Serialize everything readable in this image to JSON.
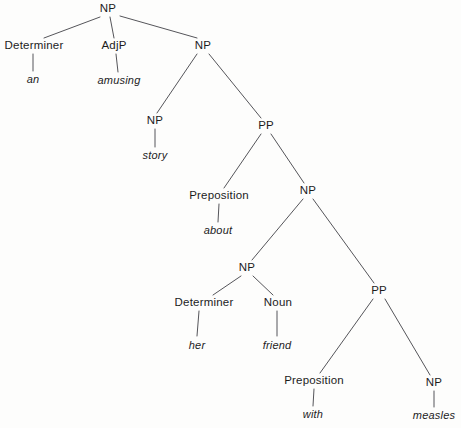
{
  "diagram": {
    "sentence": "an amusing story about her friend with measles",
    "line_color": "#55555a",
    "text_color": "#1c1c1c",
    "background_color": "#fdfdfc",
    "nodes": [
      {
        "id": "np-root",
        "label": "NP",
        "kind": "category",
        "x": 108,
        "y": 9
      },
      {
        "id": "det-1",
        "label": "Determiner",
        "kind": "category",
        "x": 34,
        "y": 46
      },
      {
        "id": "word-an",
        "label": "an",
        "kind": "word",
        "x": 33,
        "y": 79
      },
      {
        "id": "adjp-1",
        "label": "AdjP",
        "kind": "category",
        "x": 114,
        "y": 46
      },
      {
        "id": "word-amusing",
        "label": "amusing",
        "kind": "word",
        "x": 119,
        "y": 80
      },
      {
        "id": "np-2",
        "label": "NP",
        "kind": "category",
        "x": 203,
        "y": 46
      },
      {
        "id": "np-story",
        "label": "NP",
        "kind": "category",
        "x": 155,
        "y": 121
      },
      {
        "id": "word-story",
        "label": "story",
        "kind": "word",
        "x": 155,
        "y": 155
      },
      {
        "id": "pp-1",
        "label": "PP",
        "kind": "category",
        "x": 266,
        "y": 126
      },
      {
        "id": "prep-1",
        "label": "Preposition",
        "kind": "category",
        "x": 219,
        "y": 196
      },
      {
        "id": "word-about",
        "label": "about",
        "kind": "word",
        "x": 218,
        "y": 230
      },
      {
        "id": "np-3",
        "label": "NP",
        "kind": "category",
        "x": 308,
        "y": 191
      },
      {
        "id": "np-4",
        "label": "NP",
        "kind": "category",
        "x": 247,
        "y": 268
      },
      {
        "id": "det-2",
        "label": "Determiner",
        "kind": "category",
        "x": 204,
        "y": 303
      },
      {
        "id": "word-her",
        "label": "her",
        "kind": "word",
        "x": 197,
        "y": 345
      },
      {
        "id": "noun-1",
        "label": "Noun",
        "kind": "category",
        "x": 278,
        "y": 303
      },
      {
        "id": "word-friend",
        "label": "friend",
        "kind": "word",
        "x": 277,
        "y": 345
      },
      {
        "id": "pp-2",
        "label": "PP",
        "kind": "category",
        "x": 379,
        "y": 291
      },
      {
        "id": "prep-2",
        "label": "Preposition",
        "kind": "category",
        "x": 314,
        "y": 381
      },
      {
        "id": "word-with",
        "label": "with",
        "kind": "word",
        "x": 313,
        "y": 414
      },
      {
        "id": "np-5",
        "label": "NP",
        "kind": "category",
        "x": 434,
        "y": 383
      },
      {
        "id": "word-measles",
        "label": "measles",
        "kind": "word",
        "x": 434,
        "y": 415
      }
    ],
    "edges": [
      {
        "from": "np-root",
        "to": "det-1",
        "x1": 100,
        "y1": 17,
        "x2": 44,
        "y2": 38
      },
      {
        "from": "np-root",
        "to": "adjp-1",
        "x1": 110,
        "y1": 17,
        "x2": 114,
        "y2": 38
      },
      {
        "from": "np-root",
        "to": "np-2",
        "x1": 120,
        "y1": 16,
        "x2": 197,
        "y2": 38
      },
      {
        "from": "det-1",
        "to": "word-an",
        "x1": 33,
        "y1": 54,
        "x2": 33,
        "y2": 71
      },
      {
        "from": "adjp-1",
        "to": "word-amusing",
        "x1": 116,
        "y1": 54,
        "x2": 118,
        "y2": 72
      },
      {
        "from": "np-2",
        "to": "np-story",
        "x1": 197,
        "y1": 54,
        "x2": 157,
        "y2": 113
      },
      {
        "from": "np-2",
        "to": "pp-1",
        "x1": 209,
        "y1": 54,
        "x2": 261,
        "y2": 118
      },
      {
        "from": "np-story",
        "to": "word-story",
        "x1": 155,
        "y1": 129,
        "x2": 155,
        "y2": 147
      },
      {
        "from": "pp-1",
        "to": "prep-1",
        "x1": 261,
        "y1": 134,
        "x2": 224,
        "y2": 188
      },
      {
        "from": "pp-1",
        "to": "np-3",
        "x1": 271,
        "y1": 134,
        "x2": 304,
        "y2": 183
      },
      {
        "from": "prep-1",
        "to": "word-about",
        "x1": 219,
        "y1": 204,
        "x2": 218,
        "y2": 222
      },
      {
        "from": "np-3",
        "to": "np-4",
        "x1": 303,
        "y1": 199,
        "x2": 252,
        "y2": 260
      },
      {
        "from": "np-3",
        "to": "pp-2",
        "x1": 313,
        "y1": 199,
        "x2": 374,
        "y2": 283
      },
      {
        "from": "np-4",
        "to": "det-2",
        "x1": 241,
        "y1": 276,
        "x2": 213,
        "y2": 295
      },
      {
        "from": "np-4",
        "to": "noun-1",
        "x1": 253,
        "y1": 276,
        "x2": 273,
        "y2": 295
      },
      {
        "from": "det-2",
        "to": "word-her",
        "x1": 199,
        "y1": 311,
        "x2": 197,
        "y2": 336
      },
      {
        "from": "noun-1",
        "to": "word-friend",
        "x1": 277,
        "y1": 311,
        "x2": 277,
        "y2": 336
      },
      {
        "from": "pp-2",
        "to": "prep-2",
        "x1": 373,
        "y1": 299,
        "x2": 320,
        "y2": 373
      },
      {
        "from": "pp-2",
        "to": "np-5",
        "x1": 385,
        "y1": 299,
        "x2": 430,
        "y2": 375
      },
      {
        "from": "prep-2",
        "to": "word-with",
        "x1": 314,
        "y1": 389,
        "x2": 313,
        "y2": 406
      },
      {
        "from": "np-5",
        "to": "word-measles",
        "x1": 434,
        "y1": 391,
        "x2": 434,
        "y2": 407
      }
    ]
  }
}
